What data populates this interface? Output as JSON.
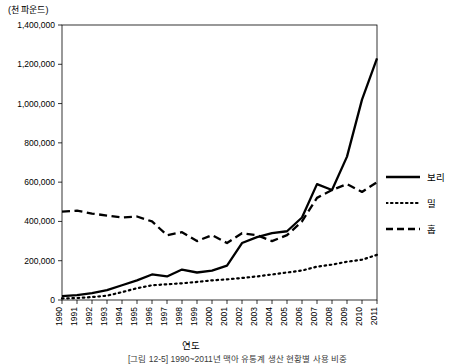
{
  "unit_label": "(천 파운드)",
  "x_axis_title": "연도",
  "caption": "[그림 12-5] 1990~2011년 맥아 유통계 생산 현황별 사용 비중",
  "legend": [
    {
      "label": "보리",
      "style": "solid"
    },
    {
      "label": "밀",
      "style": "dotted"
    },
    {
      "label": "홉",
      "style": "dashed"
    }
  ],
  "chart_data": {
    "type": "line",
    "title": "",
    "xlabel": "연도",
    "ylabel": "(천 파운드)",
    "ylim": [
      0,
      1400000
    ],
    "ytick_labels": [
      "0",
      "200,000",
      "400,000",
      "600,000",
      "800,000",
      "1,000,000",
      "1,200,000",
      "1,400,000"
    ],
    "ytick_values": [
      0,
      200000,
      400000,
      600000,
      800000,
      1000000,
      1200000,
      1400000
    ],
    "grid": false,
    "legend_position": "right",
    "categories": [
      "1990",
      "1991",
      "1992",
      "1993",
      "1994",
      "1995",
      "1996",
      "1997",
      "1998",
      "1999",
      "2000",
      "2001",
      "2002",
      "2003",
      "2004",
      "2005",
      "2006",
      "2007",
      "2008",
      "2009",
      "2010",
      "2011"
    ],
    "series": [
      {
        "name": "보리",
        "style": "solid",
        "values": [
          20000,
          25000,
          35000,
          50000,
          75000,
          100000,
          130000,
          120000,
          155000,
          140000,
          150000,
          175000,
          290000,
          320000,
          340000,
          350000,
          420000,
          590000,
          560000,
          730000,
          1020000,
          1230000
        ]
      },
      {
        "name": "밀",
        "style": "dotted",
        "values": [
          8000,
          10000,
          15000,
          22000,
          40000,
          60000,
          75000,
          80000,
          85000,
          92000,
          100000,
          105000,
          112000,
          120000,
          130000,
          140000,
          150000,
          170000,
          180000,
          195000,
          205000,
          230000
        ]
      },
      {
        "name": "홉",
        "style": "dashed",
        "values": [
          450000,
          455000,
          440000,
          430000,
          420000,
          425000,
          400000,
          330000,
          345000,
          300000,
          330000,
          290000,
          340000,
          330000,
          300000,
          330000,
          400000,
          520000,
          560000,
          590000,
          550000,
          600000
        ]
      }
    ]
  }
}
